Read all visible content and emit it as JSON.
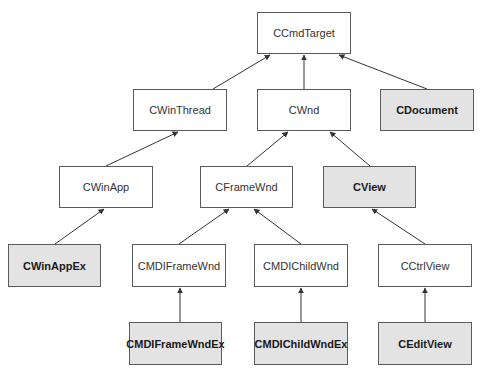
{
  "diagram": {
    "colors": {
      "plain_fill": "#ffffff",
      "highlight_fill": "#e3e3e3",
      "border": "#5a5a5a",
      "edge": "#333333"
    },
    "nodes": [
      {
        "id": "ccmdtarget",
        "label": "CCmdTarget",
        "highlight": false,
        "x": 257,
        "y": 12,
        "w": 94,
        "h": 42
      },
      {
        "id": "cwinthread",
        "label": "CWinThread",
        "highlight": false,
        "x": 133,
        "y": 89,
        "w": 94,
        "h": 42
      },
      {
        "id": "cwnd",
        "label": "CWnd",
        "highlight": false,
        "x": 257,
        "y": 89,
        "w": 94,
        "h": 42
      },
      {
        "id": "cdocument",
        "label": "CDocument",
        "highlight": true,
        "x": 380,
        "y": 89,
        "w": 94,
        "h": 42
      },
      {
        "id": "cwinapp",
        "label": "CWinApp",
        "highlight": false,
        "x": 59,
        "y": 166,
        "w": 94,
        "h": 42
      },
      {
        "id": "cframewnd",
        "label": "CFrameWnd",
        "highlight": false,
        "x": 200,
        "y": 166,
        "w": 93,
        "h": 42
      },
      {
        "id": "cview",
        "label": "CView",
        "highlight": true,
        "x": 323,
        "y": 166,
        "w": 93,
        "h": 42
      },
      {
        "id": "cwinappex",
        "label": "CWinAppEx",
        "highlight": true,
        "x": 8,
        "y": 244,
        "w": 93,
        "h": 43
      },
      {
        "id": "cmdiframewnd",
        "label": "CMDIFrameWnd",
        "highlight": false,
        "x": 132,
        "y": 244,
        "w": 94,
        "h": 43
      },
      {
        "id": "cmdichildwnd",
        "label": "CMDIChildWnd",
        "highlight": false,
        "x": 254,
        "y": 244,
        "w": 94,
        "h": 43
      },
      {
        "id": "cctrlview",
        "label": "CCtrlView",
        "highlight": false,
        "x": 378,
        "y": 244,
        "w": 94,
        "h": 43
      },
      {
        "id": "cmdiframewndex",
        "label": "CMDIFrameWndEx",
        "highlight": true,
        "x": 129,
        "y": 322,
        "w": 93,
        "h": 43
      },
      {
        "id": "cmdichildwndex",
        "label": "CMDIChildWndEx",
        "highlight": true,
        "x": 254,
        "y": 322,
        "w": 94,
        "h": 43
      },
      {
        "id": "ceditview",
        "label": "CEditView",
        "highlight": true,
        "x": 378,
        "y": 322,
        "w": 94,
        "h": 43
      }
    ],
    "edges": [
      {
        "from": "cwinthread",
        "to": "ccmdtarget",
        "x1": 213,
        "y1": 89,
        "x2": 270,
        "y2": 55
      },
      {
        "from": "cwnd",
        "to": "ccmdtarget",
        "x1": 304,
        "y1": 89,
        "x2": 304,
        "y2": 55
      },
      {
        "from": "cdocument",
        "to": "ccmdtarget",
        "x1": 427,
        "y1": 89,
        "x2": 339,
        "y2": 55
      },
      {
        "from": "cwinapp",
        "to": "cwinthread",
        "x1": 106,
        "y1": 166,
        "x2": 178,
        "y2": 132
      },
      {
        "from": "cframewnd",
        "to": "cwnd",
        "x1": 247,
        "y1": 166,
        "x2": 288,
        "y2": 132
      },
      {
        "from": "cview",
        "to": "cwnd",
        "x1": 370,
        "y1": 166,
        "x2": 330,
        "y2": 132
      },
      {
        "from": "cwinappex",
        "to": "cwinapp",
        "x1": 55,
        "y1": 244,
        "x2": 104,
        "y2": 209
      },
      {
        "from": "cmdiframewnd",
        "to": "cframewnd",
        "x1": 179,
        "y1": 244,
        "x2": 229,
        "y2": 209
      },
      {
        "from": "cmdichildwnd",
        "to": "cframewnd",
        "x1": 301,
        "y1": 244,
        "x2": 254,
        "y2": 209
      },
      {
        "from": "cctrlview",
        "to": "cview",
        "x1": 425,
        "y1": 244,
        "x2": 372,
        "y2": 209
      },
      {
        "from": "cmdiframewndex",
        "to": "cmdiframewnd",
        "x1": 180,
        "y1": 322,
        "x2": 180,
        "y2": 288
      },
      {
        "from": "cmdichildwndex",
        "to": "cmdichildwnd",
        "x1": 301,
        "y1": 322,
        "x2": 301,
        "y2": 288
      },
      {
        "from": "ceditview",
        "to": "cctrlview",
        "x1": 425,
        "y1": 322,
        "x2": 425,
        "y2": 288
      }
    ]
  }
}
